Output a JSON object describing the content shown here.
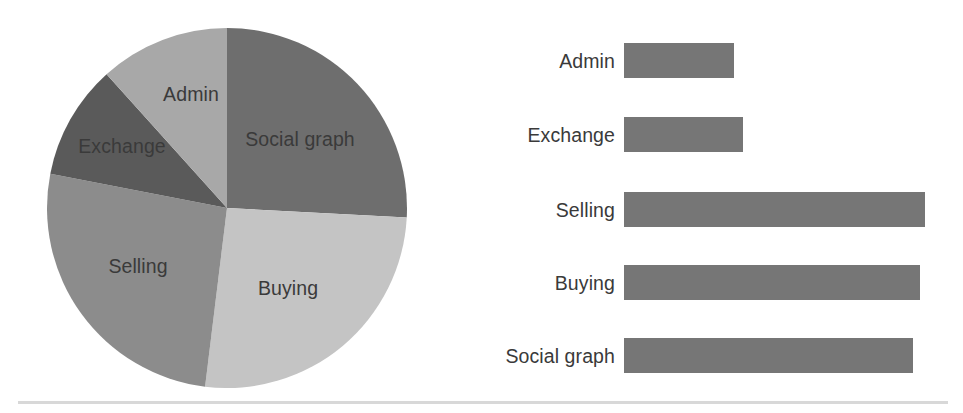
{
  "chart_data": [
    {
      "type": "pie",
      "title": "",
      "labels": [
        "Social graph",
        "Buying",
        "Selling",
        "Exchange",
        "Admin"
      ],
      "values": [
        26,
        26,
        26,
        10,
        12
      ],
      "unit": "percent",
      "start_angle_deg": 0,
      "direction": "clockwise",
      "legend": "none",
      "labels_placement": "inside-slices",
      "slice_colors": [
        "#6E6E6E",
        "#C4C4C4",
        "#8C8C8C",
        "#5A5A5A",
        "#A8A8A8"
      ],
      "slices": [
        {
          "label": "Social graph",
          "value": 26,
          "start_deg": 0,
          "end_deg": 93,
          "color": "#6E6E6E",
          "label_x": 300,
          "label_y": 139
        },
        {
          "label": "Buying",
          "value": 26,
          "start_deg": 93,
          "end_deg": 187,
          "color": "#C4C4C4",
          "label_x": 288,
          "label_y": 288
        },
        {
          "label": "Selling",
          "value": 26,
          "start_deg": 187,
          "end_deg": 281,
          "color": "#8C8C8C",
          "label_x": 138,
          "label_y": 266
        },
        {
          "label": "Exchange",
          "value": 10,
          "start_deg": 281,
          "end_deg": 318,
          "color": "#5A5A5A",
          "label_x": 122,
          "label_y": 146
        },
        {
          "label": "Admin",
          "value": 12,
          "start_deg": 318,
          "end_deg": 360,
          "color": "#A8A8A8",
          "label_x": 191,
          "label_y": 94
        }
      ],
      "geometry": {
        "cx": 227,
        "cy": 208,
        "r": 180
      }
    },
    {
      "type": "bar",
      "orientation": "horizontal",
      "title": "",
      "xlabel": "",
      "ylabel": "",
      "grid": false,
      "legend": "none",
      "axis_labels_visible": false,
      "bar_color": "#767676",
      "categories": [
        "Admin",
        "Exchange",
        "Selling",
        "Buying",
        "Social graph"
      ],
      "values": [
        110,
        119,
        301,
        296,
        289
      ],
      "value_unit": "px-length",
      "xlim": [
        0,
        310
      ],
      "bars": [
        {
          "label": "Admin",
          "value": 110,
          "length_px": 110,
          "top": 43
        },
        {
          "label": "Exchange",
          "value": 119,
          "length_px": 119,
          "top": 117
        },
        {
          "label": "Selling",
          "value": 301,
          "length_px": 301,
          "top": 192
        },
        {
          "label": "Buying",
          "value": 296,
          "length_px": 296,
          "top": 265
        },
        {
          "label": "Social graph",
          "value": 289,
          "length_px": 289,
          "top": 338
        }
      ]
    }
  ],
  "figure": {
    "pie": {
      "name": "pie-chart",
      "labels": {
        "social_graph": "Social graph",
        "buying": "Buying",
        "selling": "Selling",
        "exchange": "Exchange",
        "admin": "Admin"
      }
    },
    "bars": {
      "name": "bar-chart",
      "labels": {
        "admin": "Admin",
        "exchange": "Exchange",
        "selling": "Selling",
        "buying": "Buying",
        "social_graph": "Social graph"
      }
    }
  },
  "colors": {
    "background": "#ffffff",
    "text": "#3a3a3a",
    "bar_fill": "#767676",
    "rule": "#d8d8d8"
  }
}
